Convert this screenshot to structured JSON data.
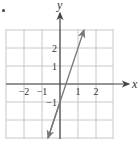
{
  "chart_data": {
    "type": "line",
    "title": "",
    "xlabel": "x",
    "ylabel": "y",
    "xlim": [
      -3,
      3
    ],
    "ylim": [
      -3,
      3
    ],
    "grid": true,
    "x_ticks": [
      {
        "value": -2,
        "label": "−2"
      },
      {
        "value": -1,
        "label": "−1"
      },
      {
        "value": 1,
        "label": "1"
      },
      {
        "value": 2,
        "label": "2"
      }
    ],
    "y_ticks": [
      {
        "value": 2,
        "label": "2"
      },
      {
        "value": 1,
        "label": "1"
      },
      {
        "value": -1,
        "label": "−1"
      }
    ],
    "series": [
      {
        "name": "y = 3x − 1",
        "slope": 3,
        "intercept": -1,
        "points": [
          [
            -0.667,
            -3
          ],
          [
            0,
            -1
          ],
          [
            0.333,
            0
          ],
          [
            1,
            2
          ],
          [
            1.333,
            3
          ]
        ],
        "arrows_both_ends": true,
        "color": "#777777"
      }
    ]
  },
  "colors": {
    "grid": "#c8c8c8",
    "axis": "#444444",
    "line": "#777777"
  }
}
